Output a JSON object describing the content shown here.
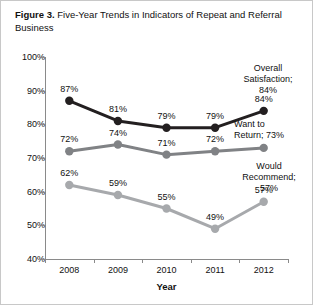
{
  "figure": {
    "number_label": "Figure 3.",
    "caption": "Five-Year Trends in Indicators of Repeat and Referral Business"
  },
  "chart_data": {
    "type": "line",
    "title": "Five-Year Trends in Indicators of Repeat and Referral Business",
    "xlabel": "Year",
    "ylabel": "",
    "categories": [
      "2008",
      "2009",
      "2010",
      "2011",
      "2012"
    ],
    "ylim": [
      40,
      100
    ],
    "yticks": [
      "40%",
      "50%",
      "60%",
      "70%",
      "80%",
      "90%",
      "100%"
    ],
    "ytick_values": [
      40,
      50,
      60,
      70,
      80,
      90,
      100
    ],
    "grid": false,
    "legend_position": "right-inline-annotations",
    "series": [
      {
        "name": "Overall Satisfaction",
        "color": "#231f20",
        "values": [
          87,
          81,
          79,
          79,
          84
        ],
        "labels": [
          "87%",
          "81%",
          "79%",
          "79%",
          "84%"
        ]
      },
      {
        "name": "Want to Return",
        "color": "#808285",
        "values": [
          72,
          74,
          71,
          72,
          73
        ],
        "labels": [
          "72%",
          "74%",
          "71%",
          "72%",
          "73%"
        ]
      },
      {
        "name": "Would Recommend",
        "color": "#a7a9ac",
        "values": [
          62,
          59,
          55,
          49,
          57
        ],
        "labels": [
          "62%",
          "59%",
          "55%",
          "49%",
          "57%"
        ]
      }
    ],
    "annotations": [
      {
        "text": "Overall\nSatisfaction;\n84%",
        "series": "Overall Satisfaction"
      },
      {
        "text": "Want to\nReturn; 73%",
        "series": "Want to Return"
      },
      {
        "text": "Would\nRecommend;\n57%",
        "series": "Would Recommend"
      }
    ]
  }
}
